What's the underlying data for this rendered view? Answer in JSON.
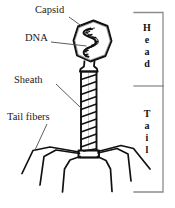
{
  "figure": {
    "background_color": "#ffffff",
    "ink_color": "#111111",
    "leader_color": "#555555",
    "labels": {
      "capsid": "Capsid",
      "dna": "DNA",
      "sheath": "Sheath",
      "tail_fibers": "Tail fibers"
    },
    "brackets": {
      "head": {
        "text": "Head",
        "letters": [
          "H",
          "e",
          "a",
          "d"
        ]
      },
      "tail": {
        "text": "Tail",
        "letters": [
          "T",
          "a",
          "i",
          "l"
        ]
      }
    }
  }
}
